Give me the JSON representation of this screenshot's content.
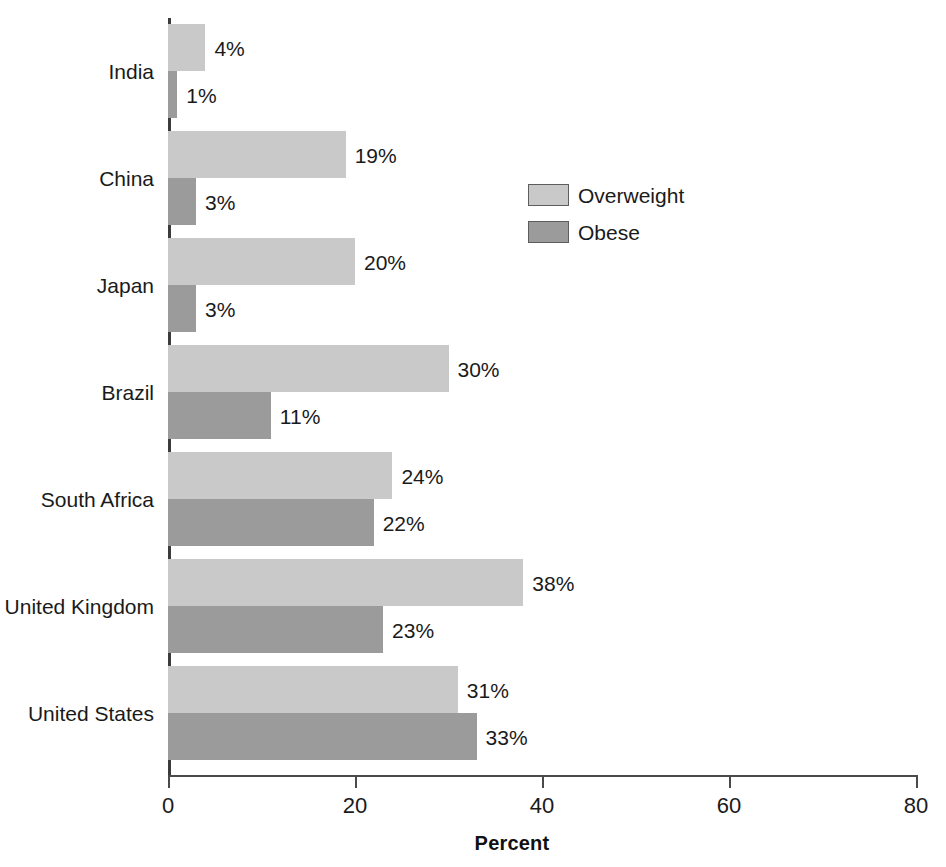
{
  "chart_data": {
    "type": "bar",
    "orientation": "horizontal",
    "title": "",
    "xlabel": "Percent",
    "ylabel": "",
    "xlim": [
      0,
      80
    ],
    "xticks": [
      0,
      20,
      40,
      60,
      80
    ],
    "xtick_labels": [
      "0",
      "20",
      "40",
      "60",
      "80"
    ],
    "grid": false,
    "legend_position": "inside-upper-right",
    "categories": [
      "India",
      "China",
      "Japan",
      "Brazil",
      "South Africa",
      "United Kingdom",
      "United States"
    ],
    "series": [
      {
        "name": "Overweight",
        "color": "#c9c9c9",
        "values": [
          4,
          19,
          20,
          30,
          24,
          38,
          31
        ],
        "labels": [
          "4%",
          "19%",
          "20%",
          "30%",
          "24%",
          "38%",
          "31%"
        ]
      },
      {
        "name": "Obese",
        "color": "#9b9b9b",
        "values": [
          1,
          3,
          3,
          11,
          22,
          23,
          33
        ],
        "labels": [
          "1%",
          "3%",
          "3%",
          "11%",
          "22%",
          "23%",
          "33%"
        ]
      }
    ]
  },
  "axis": {
    "x_title": "Percent",
    "tick_labels": [
      "0",
      "20",
      "40",
      "60",
      "80"
    ]
  },
  "legend": {
    "items": [
      {
        "label": "Overweight",
        "color": "#c9c9c9"
      },
      {
        "label": "Obese",
        "color": "#9b9b9b"
      }
    ]
  }
}
